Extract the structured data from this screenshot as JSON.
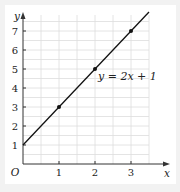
{
  "chart_data": {
    "type": "line",
    "title": "",
    "xlabel": "x",
    "ylabel": "y",
    "origin_label": "O",
    "x_ticks": [
      "1",
      "2",
      "3"
    ],
    "y_ticks": [
      "1",
      "2",
      "3",
      "4",
      "5",
      "6",
      "7"
    ],
    "xlim": [
      0,
      4
    ],
    "ylim": [
      0,
      8
    ],
    "grid": true,
    "grid_step": 0.5,
    "series": [
      {
        "name": "y = 2x + 1",
        "equation": "y = 2x + 1",
        "x": [
          0,
          3.5
        ],
        "y": [
          1,
          8
        ],
        "marked_points": [
          {
            "x": 1,
            "y": 3
          },
          {
            "x": 2,
            "y": 5
          },
          {
            "x": 3,
            "y": 7
          }
        ]
      }
    ],
    "annotations": [
      {
        "text": "y = 2x + 1",
        "x": 2.1,
        "y": 4.5
      }
    ]
  },
  "colors": {
    "line": "#111111",
    "grid": "#dddddd",
    "axis": "#333333",
    "background": "#ffffff",
    "frame": "#f2f2f2"
  }
}
